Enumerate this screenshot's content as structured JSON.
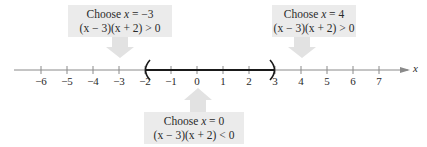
{
  "regions": [
    {
      "id": "left",
      "choose_label": "Choose",
      "var": "x",
      "equals": "= −3",
      "expr": "(x − 3)(x + 2) > 0"
    },
    {
      "id": "middle",
      "choose_label": "Choose",
      "var": "x",
      "equals": "= 0",
      "expr": "(x − 3)(x + 2) < 0"
    },
    {
      "id": "right",
      "choose_label": "Choose",
      "var": "x",
      "equals": "= 4",
      "expr": "(x − 3)(x + 2) > 0"
    }
  ],
  "axis": {
    "variable": "x",
    "ticks": [
      "−6",
      "−5",
      "−4",
      "−3",
      "−2",
      "−1",
      "0",
      "1",
      "2",
      "3",
      "4",
      "5",
      "6",
      "7"
    ]
  },
  "interval": {
    "open_left": "(",
    "open_right": ")",
    "from": -2,
    "to": 3
  },
  "colors": {
    "box": "#ebebeb",
    "arrow": "#e2e2e2",
    "axis": "#8a8a8a",
    "interval": "#1a1a1a"
  }
}
